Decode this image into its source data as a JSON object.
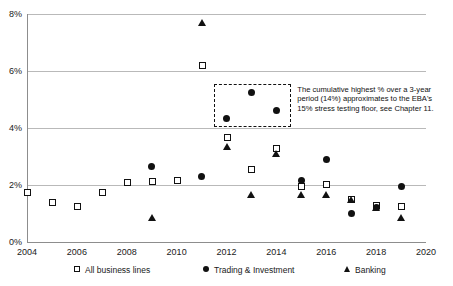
{
  "chart_data": {
    "type": "scatter",
    "title": "",
    "subtitle": "",
    "xlabel": "",
    "ylabel": "",
    "xlim": [
      2004,
      2020
    ],
    "ylim": [
      0,
      8
    ],
    "grid": true,
    "y_tick_labels": [
      "0%",
      "2%",
      "4%",
      "6%",
      "8%"
    ],
    "y_tick_values": [
      0,
      2,
      4,
      6,
      8
    ],
    "x_tick_labels": [
      "2004",
      "2006",
      "2008",
      "2010",
      "2012",
      "2014",
      "2016",
      "2018",
      "2020"
    ],
    "x_tick_values": [
      2004,
      2006,
      2008,
      2010,
      2012,
      2014,
      2016,
      2018,
      2020
    ],
    "legend_position": "bottom",
    "series": [
      {
        "name": "All business lines",
        "marker": "square-open",
        "points": [
          {
            "x": 2004,
            "y": 1.75
          },
          {
            "x": 2005,
            "y": 1.4
          },
          {
            "x": 2006,
            "y": 1.25
          },
          {
            "x": 2007,
            "y": 1.75
          },
          {
            "x": 2008,
            "y": 2.1
          },
          {
            "x": 2009,
            "y": 2.15
          },
          {
            "x": 2010,
            "y": 2.17
          },
          {
            "x": 2011,
            "y": 6.2
          },
          {
            "x": 2012,
            "y": 3.7
          },
          {
            "x": 2013,
            "y": 2.55
          },
          {
            "x": 2014,
            "y": 3.3
          },
          {
            "x": 2015,
            "y": 1.95
          },
          {
            "x": 2016,
            "y": 2.05
          },
          {
            "x": 2017,
            "y": 1.5
          },
          {
            "x": 2018,
            "y": 1.3
          },
          {
            "x": 2019,
            "y": 1.25
          }
        ]
      },
      {
        "name": "Trading & Investment",
        "marker": "circle-filled",
        "points": [
          {
            "x": 2009,
            "y": 2.65
          },
          {
            "x": 2011,
            "y": 2.3
          },
          {
            "x": 2012,
            "y": 4.35
          },
          {
            "x": 2013,
            "y": 5.25
          },
          {
            "x": 2014,
            "y": 4.6
          },
          {
            "x": 2015,
            "y": 2.15
          },
          {
            "x": 2016,
            "y": 2.9
          },
          {
            "x": 2017,
            "y": 1.0
          },
          {
            "x": 2018,
            "y": 1.2
          },
          {
            "x": 2019,
            "y": 1.95
          }
        ]
      },
      {
        "name": "Banking",
        "marker": "triangle-filled",
        "points": [
          {
            "x": 2009,
            "y": 0.85
          },
          {
            "x": 2011,
            "y": 7.7
          },
          {
            "x": 2012,
            "y": 3.35
          },
          {
            "x": 2013,
            "y": 1.65
          },
          {
            "x": 2014,
            "y": 3.1
          },
          {
            "x": 2015,
            "y": 1.65
          },
          {
            "x": 2016,
            "y": 1.65
          },
          {
            "x": 2017,
            "y": 1.5
          },
          {
            "x": 2018,
            "y": 1.2
          },
          {
            "x": 2019,
            "y": 0.85
          }
        ]
      }
    ],
    "annotations": [
      {
        "type": "dashed-rectangle",
        "x_range": [
          2011.5,
          2014.6
        ],
        "y_range": [
          4.05,
          5.55
        ]
      },
      {
        "type": "text",
        "text": "The cumulative highest % over a 3-year period (14%) approximates to the EBA's 15% stress testing floor, see Chapter 11."
      }
    ],
    "colors": {
      "marker": "#111111",
      "gridline": "#b9b9b9",
      "axis": "#8d8d8d",
      "text": "#1a1a1a",
      "background": "#ffffff"
    }
  }
}
